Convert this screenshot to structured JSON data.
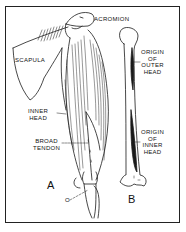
{
  "figure": {
    "panels": [
      {
        "id": "A",
        "label": "A"
      },
      {
        "id": "B",
        "label": "B"
      }
    ],
    "labels": {
      "acromion": "ACROMION",
      "scapula": "SCAPULA",
      "inner_head_1": "INNER",
      "inner_head_2": "HEAD",
      "broad_tendon_1": "BROAD",
      "broad_tendon_2": "TENDON",
      "insertion": "O",
      "origin_outer_1": "ORIGIN",
      "origin_outer_2": "OF",
      "origin_outer_3": "OUTER",
      "origin_outer_4": "HEAD",
      "origin_inner_1": "ORIGIN",
      "origin_inner_2": "OF",
      "origin_inner_3": "INNER",
      "origin_inner_4": "HEAD"
    },
    "colors": {
      "ink": "#1a1a1a",
      "paper": "#ffffff"
    }
  }
}
